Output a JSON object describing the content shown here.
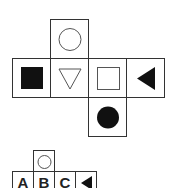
{
  "net": {
    "description": "Unfolded cube net with six faces",
    "faces": [
      {
        "position": "top",
        "symbol": "circle-outline"
      },
      {
        "position": "left",
        "symbol": "square-filled"
      },
      {
        "position": "center",
        "symbol": "triangle-down-outline"
      },
      {
        "position": "center-right",
        "symbol": "square-outline"
      },
      {
        "position": "right",
        "symbol": "triangle-left-filled"
      },
      {
        "position": "bottom",
        "symbol": "circle-filled"
      }
    ]
  },
  "options": {
    "top_symbol": "circle-outline",
    "labels": [
      "A",
      "B",
      "C"
    ],
    "last_symbol": "triangle-left-filled"
  },
  "colors": {
    "stroke": "#333333",
    "fill": "#111111",
    "background": "#ffffff"
  }
}
